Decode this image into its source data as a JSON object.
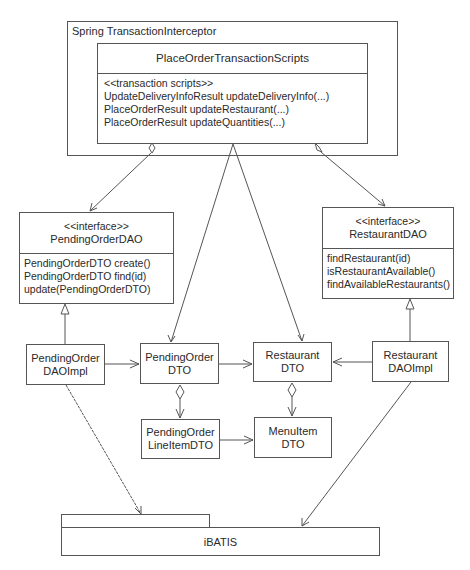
{
  "outer_container": {
    "label": "Spring TransactionInterceptor"
  },
  "transaction_scripts": {
    "title": "PlaceOrderTransactionScripts",
    "operations": [
      "<<transaction scripts>>",
      "UpdateDeliveryInfoResult updateDeliveryInfo(...)",
      "PlaceOrderResult updateRestaurant(...)",
      "PlaceOrderResult updateQuantities(...)"
    ]
  },
  "pending_order_dao": {
    "stereotype": "<<interface>>",
    "name": "PendingOrderDAO",
    "operations": [
      "PendingOrderDTO create()",
      "PendingOrderDTO find(id)",
      "update(PendingOrderDTO)"
    ]
  },
  "restaurant_dao": {
    "stereotype": "<<interface>>",
    "name": "RestaurantDAO",
    "operations": [
      "findRestaurant(id)",
      "isRestaurantAvailable()",
      "findAvailableRestaurants()"
    ]
  },
  "classes": {
    "pending_order_dao_impl": {
      "line1": "PendingOrder",
      "line2": "DAOImpl"
    },
    "pending_order_dto": {
      "line1": "PendingOrder",
      "line2": "DTO"
    },
    "restaurant_dto": {
      "line1": "Restaurant",
      "line2": "DTO"
    },
    "restaurant_dao_impl": {
      "line1": "Restaurant",
      "line2": "DAOImpl"
    },
    "pending_order_line_item_dto": {
      "line1": "PendingOrder",
      "line2": "LineItemDTO"
    },
    "menu_item_dto": {
      "line1": "MenuItem",
      "line2": "DTO"
    }
  },
  "ibatis": {
    "label": "iBATIS"
  },
  "colors": {
    "line": "#555555",
    "text": "#2a2a2a",
    "background": "#ffffff"
  }
}
